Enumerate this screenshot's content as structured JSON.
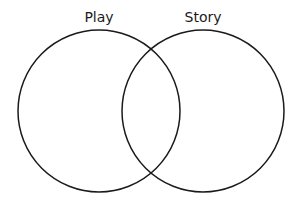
{
  "diagram": {
    "type": "venn",
    "sets": [
      {
        "label": "Play",
        "cx": 99,
        "cy": 111,
        "r": 81
      },
      {
        "label": "Story",
        "cx": 203,
        "cy": 111,
        "r": 81
      }
    ],
    "stroke_color": "#1a1a1a",
    "background": "#ffffff"
  }
}
